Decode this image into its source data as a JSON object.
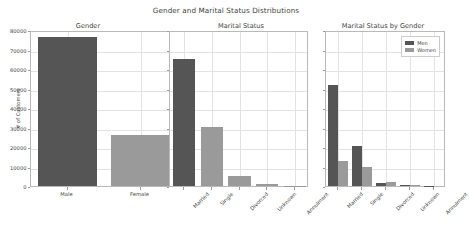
{
  "figure": {
    "suptitle": "Gender and Marital Status Distributions",
    "background": "#ffffff",
    "grid_color": "#e3e3e3",
    "axis_color": "#b9b9b9"
  },
  "colors": {
    "dark": "#555555",
    "light": "#9a9a9a"
  },
  "chart_data": [
    {
      "type": "bar",
      "title": "Gender",
      "categories": [
        "Male",
        "Female"
      ],
      "values": [
        76500,
        26300
      ],
      "bar_colors": [
        "#555555",
        "#9a9a9a"
      ],
      "xlabel": "",
      "ylabel": "# of Customers",
      "ylim": [
        0,
        80000
      ],
      "yticks": [
        0,
        10000,
        20000,
        30000,
        40000,
        50000,
        60000,
        70000,
        80000
      ],
      "ytick_labels": [
        "0",
        "10000",
        "20000",
        "30000",
        "40000",
        "50000",
        "60000",
        "70000",
        "80000"
      ],
      "grid": true,
      "legend": null,
      "xtick_rotation": 0
    },
    {
      "type": "bar",
      "title": "Marital Status",
      "categories": [
        "Married",
        "Single",
        "Divorced",
        "Unknown",
        "Annulment"
      ],
      "values": [
        65000,
        30500,
        5000,
        1100,
        120
      ],
      "bar_colors": [
        "#555555",
        "#9a9a9a",
        "#9a9a9a",
        "#9a9a9a",
        "#9a9a9a"
      ],
      "xlabel": "",
      "ylabel": "",
      "ylim": [
        0,
        80000
      ],
      "yticks": [
        0,
        10000,
        20000,
        30000,
        40000,
        50000,
        60000,
        70000,
        80000
      ],
      "ytick_labels": [
        "",
        "",
        "",
        "",
        "",
        "",
        "",
        "",
        ""
      ],
      "grid": true,
      "legend": null,
      "xtick_rotation": 45
    },
    {
      "type": "bar",
      "title": "Marital Status by Gender",
      "categories": [
        "Married",
        "Single",
        "Divorced",
        "Unknown",
        "Annulment"
      ],
      "series": [
        {
          "name": "Men",
          "color": "#555555",
          "values": [
            52000,
            20400,
            1800,
            700,
            90
          ]
        },
        {
          "name": "Women",
          "color": "#9a9a9a",
          "values": [
            12800,
            9500,
            2200,
            380,
            40
          ]
        }
      ],
      "xlabel": "",
      "ylabel": "",
      "ylim": [
        0,
        80000
      ],
      "yticks": [
        0,
        10000,
        20000,
        30000,
        40000,
        50000,
        60000,
        70000,
        80000
      ],
      "ytick_labels": [
        "",
        "",
        "",
        "",
        "",
        "",
        "",
        "",
        ""
      ],
      "grid": true,
      "legend": {
        "position": "upper right",
        "entries": [
          "Men",
          "Women"
        ]
      },
      "xtick_rotation": 45
    }
  ]
}
